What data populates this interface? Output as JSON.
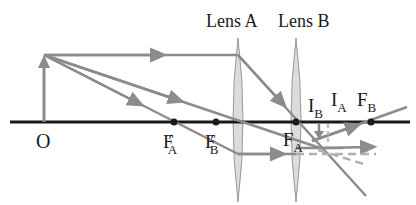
{
  "diagram": {
    "type": "two-lens optical ray diagram",
    "object_label": "O",
    "lenses": [
      {
        "label": "Lens A"
      },
      {
        "label": "Lens B"
      }
    ],
    "points": {
      "fa_prime": {
        "main": "F",
        "prime": "′",
        "sub": "A"
      },
      "fb_prime": {
        "main": "F",
        "prime": "′",
        "sub": "B"
      },
      "fa": {
        "main": "F",
        "sub": "A"
      },
      "fb": {
        "main": "F",
        "sub": "B"
      },
      "ib": {
        "main": "I",
        "sub": "B"
      },
      "ia": {
        "main": "I",
        "sub": "A"
      }
    },
    "colors": {
      "axis": "#1a1a1a",
      "ray": "#8c8c8c",
      "lens_fill": "#dcdcdc",
      "lens_stroke": "#999999",
      "dashed_ray": "#b0b0b0"
    }
  }
}
